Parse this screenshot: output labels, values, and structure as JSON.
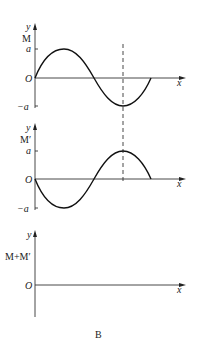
{
  "figure_label": "B",
  "panels": [
    {
      "name": "M",
      "y_label": "y",
      "series_label": "M",
      "origin_label": "O",
      "x_label": "x",
      "tick_pos_label": "a",
      "tick_neg_label": "−a",
      "curve": "sine wave starting at origin going up, peak a, trough −a, ends after 3/4 period on axis"
    },
    {
      "name": "M-prime",
      "y_label": "y",
      "series_label": "M′",
      "origin_label": "O",
      "x_label": "x",
      "tick_pos_label": "a",
      "tick_neg_label": "−a",
      "curve": "inverted sine wave starting at origin going down, trough −a, peak a"
    },
    {
      "name": "M-plus-M-prime",
      "y_label": "y",
      "series_label": "M+M′",
      "origin_label": "O",
      "x_label": "x",
      "curve": "empty (zero)"
    }
  ],
  "dashed_line": "vertical dashed line through trough of M and peak of M′"
}
